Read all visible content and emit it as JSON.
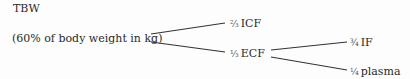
{
  "diagram": {
    "type": "tree",
    "root": {
      "title": "TBW",
      "subtitle": "(60% of body weight in kg)"
    },
    "children": [
      {
        "fraction": "⅔",
        "label": "ICF"
      },
      {
        "fraction": "⅓",
        "label": "ECF",
        "children": [
          {
            "fraction": "¾",
            "label": "IF"
          },
          {
            "fraction": "¼",
            "label": "plasma"
          }
        ]
      }
    ],
    "line_color": "#333333",
    "text_color": "#2a2a2a"
  }
}
